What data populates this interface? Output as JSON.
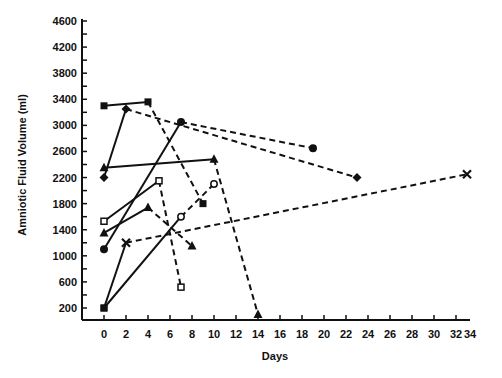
{
  "chart_data": {
    "type": "line",
    "title": "",
    "xlabel": "Days",
    "ylabel": "Amniotic Fluid Volume (ml)",
    "xlim": [
      0,
      34
    ],
    "ylim": [
      200,
      4600
    ],
    "x_ticks": [
      0,
      2,
      4,
      6,
      8,
      10,
      12,
      14,
      16,
      18,
      20,
      22,
      24,
      26,
      28,
      30,
      32,
      34
    ],
    "y_ticks": [
      200,
      600,
      1000,
      1400,
      1800,
      2200,
      2600,
      3000,
      3400,
      3800,
      4200,
      4600
    ],
    "grid": false,
    "legend": null,
    "series": [
      {
        "name": "patient-1",
        "marker": "filled-square",
        "points": [
          [
            0,
            3300
          ],
          [
            4,
            3360
          ],
          [
            9,
            1800
          ]
        ],
        "styles": [
          "solid",
          "dashed"
        ]
      },
      {
        "name": "patient-2",
        "marker": "filled-diamond",
        "points": [
          [
            0,
            2200
          ],
          [
            2,
            3250
          ],
          [
            23,
            2200
          ]
        ],
        "styles": [
          "solid",
          "dashed"
        ]
      },
      {
        "name": "patient-3",
        "marker": "filled-triangle",
        "points": [
          [
            0,
            2350
          ],
          [
            10,
            2480
          ],
          [
            14,
            100
          ]
        ],
        "styles": [
          "solid",
          "dashed"
        ]
      },
      {
        "name": "patient-4",
        "marker": "open-square",
        "points": [
          [
            0,
            1530
          ],
          [
            5,
            2150
          ],
          [
            7,
            520
          ]
        ],
        "styles": [
          "solid",
          "dashed"
        ]
      },
      {
        "name": "patient-5",
        "marker": "filled-triangle",
        "points": [
          [
            0,
            1350
          ],
          [
            4,
            1740
          ],
          [
            8,
            1150
          ]
        ],
        "styles": [
          "solid",
          "dashed"
        ]
      },
      {
        "name": "patient-6",
        "marker": "filled-circle",
        "points": [
          [
            0,
            1100
          ],
          [
            7,
            3050
          ],
          [
            19,
            2650
          ]
        ],
        "styles": [
          "solid",
          "dashed"
        ]
      },
      {
        "name": "patient-7",
        "marker": "cross",
        "points": [
          [
            0,
            200
          ],
          [
            2,
            1200
          ],
          [
            33,
            2250
          ]
        ],
        "styles": [
          "solid",
          "dashed"
        ]
      },
      {
        "name": "patient-8",
        "marker": "open-circle",
        "points": [
          [
            0,
            200
          ],
          [
            7,
            1600
          ],
          [
            10,
            2100
          ]
        ],
        "styles": [
          "solid",
          "dashed"
        ]
      }
    ]
  },
  "colors": {
    "ink": "#111111",
    "background": "#ffffff"
  }
}
